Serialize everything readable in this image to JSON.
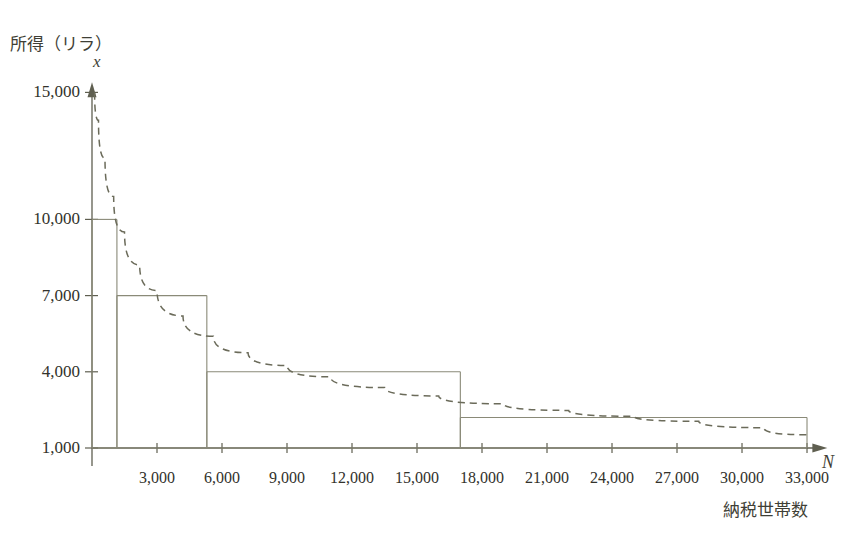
{
  "figure": {
    "y_axis_title": "所得（リラ）",
    "y_axis_var": "x",
    "x_axis_title": "納税世帯数",
    "x_axis_var": "N"
  },
  "chart_data": {
    "type": "bar",
    "title": "",
    "subtitle": "",
    "xlabel": "納税世帯数",
    "ylabel": "所得（リラ）",
    "x_var": "N",
    "y_var": "x",
    "xlim": [
      0,
      34500
    ],
    "ylim": [
      0,
      15500
    ],
    "grid": false,
    "legend": null,
    "axis_style": "arrow-ended open axes, no frame",
    "y_ticks": [
      {
        "value": 15000,
        "label": "15,000"
      },
      {
        "value": 10000,
        "label": "10,000"
      },
      {
        "value": 7000,
        "label": "7,000"
      },
      {
        "value": 4000,
        "label": "4,000"
      },
      {
        "value": 1000,
        "label": "1,000"
      }
    ],
    "x_ticks": [
      {
        "value": 3000,
        "label": "3,000"
      },
      {
        "value": 6000,
        "label": "6,000"
      },
      {
        "value": 9000,
        "label": "9,000"
      },
      {
        "value": 12000,
        "label": "12,000"
      },
      {
        "value": 15000,
        "label": "15,000"
      },
      {
        "value": 18000,
        "label": "18,000"
      },
      {
        "value": 21000,
        "label": "21,000"
      },
      {
        "value": 24000,
        "label": "24,000"
      },
      {
        "value": 27000,
        "label": "27,000"
      },
      {
        "value": 30000,
        "label": "30,000"
      },
      {
        "value": 33000,
        "label": "33,000"
      }
    ],
    "series": [
      {
        "name": "所得階級ステップ",
        "type": "step",
        "style": "solid thin line, unfilled rectangles",
        "color": "#8a8a78",
        "baseline": 1000,
        "steps": [
          {
            "x_start": 0,
            "x_end": 1150,
            "y": 10000
          },
          {
            "x_start": 1150,
            "x_end": 5300,
            "y": 7000
          },
          {
            "x_start": 5300,
            "x_end": 17000,
            "y": 4000
          },
          {
            "x_start": 17000,
            "x_end": 33000,
            "y": 2200
          }
        ]
      },
      {
        "name": "理論曲線（パレート曲線）",
        "type": "line",
        "style": "dashed",
        "color": "#6b6b5a",
        "points": [
          {
            "x": 120,
            "y": 15000
          },
          {
            "x": 300,
            "y": 13900
          },
          {
            "x": 600,
            "y": 12400
          },
          {
            "x": 1000,
            "y": 10900
          },
          {
            "x": 1500,
            "y": 9500
          },
          {
            "x": 2200,
            "y": 8200
          },
          {
            "x": 3000,
            "y": 7200
          },
          {
            "x": 4200,
            "y": 6200
          },
          {
            "x": 5600,
            "y": 5400
          },
          {
            "x": 7200,
            "y": 4750
          },
          {
            "x": 9000,
            "y": 4250
          },
          {
            "x": 11000,
            "y": 3800
          },
          {
            "x": 13500,
            "y": 3380
          },
          {
            "x": 16000,
            "y": 3050
          },
          {
            "x": 19000,
            "y": 2740
          },
          {
            "x": 22000,
            "y": 2480
          },
          {
            "x": 25000,
            "y": 2250
          },
          {
            "x": 28000,
            "y": 2050
          },
          {
            "x": 31000,
            "y": 1800
          },
          {
            "x": 33000,
            "y": 1520
          }
        ]
      }
    ]
  },
  "colors": {
    "background": "#ffffff",
    "axis": "#5f5f50",
    "step_line": "#8a8a78",
    "curve": "#6b6b5a",
    "text": "#32322b"
  },
  "geometry": {
    "origin_px": {
      "x": 92,
      "y": 448
    },
    "x_px_per_unit": 0.021667,
    "y_px_per_unit": 0.0254,
    "y_value_at_origin": 1000
  }
}
